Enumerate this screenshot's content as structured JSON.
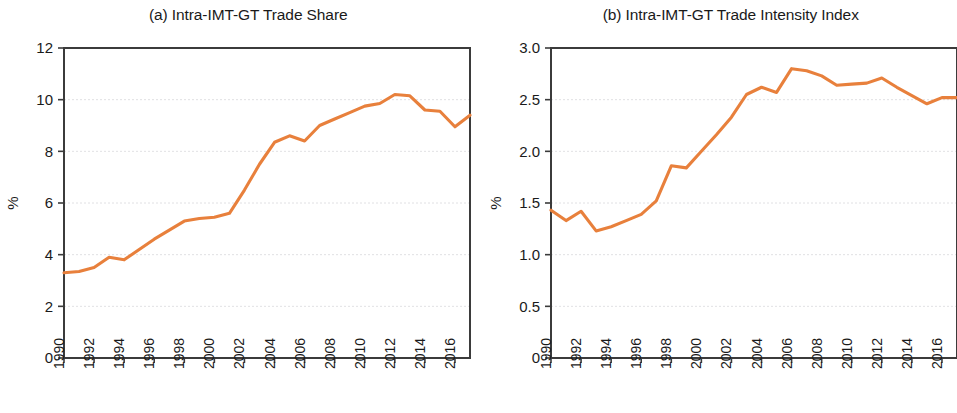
{
  "figure": {
    "panels": [
      {
        "id": "panel-a",
        "title": "(a) Intra-IMT-GT Trade Share",
        "ylabel": "%"
      },
      {
        "id": "panel-b",
        "title": "(b) Intra-IMT-GT Trade Intensity Index",
        "ylabel": "%"
      }
    ]
  },
  "chart_data": [
    {
      "type": "line",
      "title": "(a) Intra-IMT-GT Trade Share",
      "xlabel": "",
      "ylabel": "%",
      "ylim": [
        0,
        12
      ],
      "yticks": [
        0,
        2,
        4,
        6,
        8,
        10,
        12
      ],
      "ytick_labels": [
        "0",
        "2",
        "4",
        "6",
        "8",
        "10",
        "12"
      ],
      "xlim": [
        1990,
        2017
      ],
      "xticks": [
        1990,
        1992,
        1994,
        1996,
        1998,
        2000,
        2002,
        2004,
        2006,
        2008,
        2010,
        2012,
        2014,
        2016
      ],
      "xtick_labels": [
        "1990",
        "1992",
        "1994",
        "1996",
        "1998",
        "2000",
        "2002",
        "2004",
        "2006",
        "2008",
        "2010",
        "2012",
        "2014",
        "2016"
      ],
      "grid": true,
      "legend": "none",
      "line_color": "#E8803C",
      "x": [
        1990,
        1991,
        1992,
        1993,
        1994,
        1995,
        1996,
        1997,
        1998,
        1999,
        2000,
        2001,
        2002,
        2003,
        2004,
        2005,
        2006,
        2007,
        2008,
        2009,
        2010,
        2011,
        2012,
        2013,
        2014,
        2015,
        2016,
        2017
      ],
      "series": [
        {
          "name": "Intra-IMT-GT Trade Share",
          "values": [
            3.3,
            3.35,
            3.5,
            3.9,
            3.8,
            4.2,
            4.6,
            4.95,
            5.3,
            5.4,
            5.45,
            5.6,
            6.5,
            7.5,
            8.35,
            8.6,
            8.4,
            9.0,
            9.25,
            9.5,
            9.75,
            9.85,
            10.2,
            10.15,
            9.6,
            9.55,
            8.95,
            9.4
          ]
        }
      ]
    },
    {
      "type": "line",
      "title": "(b) Intra-IMT-GT Trade Intensity Index",
      "xlabel": "",
      "ylabel": "%",
      "ylim": [
        0,
        3.0
      ],
      "yticks": [
        0,
        0.5,
        1.0,
        1.5,
        2.0,
        2.5,
        3.0
      ],
      "ytick_labels": [
        "0",
        "0.5",
        "1.0",
        "1.5",
        "2.0",
        "2.5",
        "3.0"
      ],
      "xlim": [
        1990,
        2017
      ],
      "xticks": [
        1990,
        1992,
        1994,
        1996,
        1998,
        2000,
        2002,
        2004,
        2006,
        2008,
        2010,
        2012,
        2014,
        2016
      ],
      "xtick_labels": [
        "1990",
        "1992",
        "1994",
        "1996",
        "1998",
        "2000",
        "2002",
        "2004",
        "2006",
        "2008",
        "2010",
        "2012",
        "2014",
        "2016"
      ],
      "grid": true,
      "legend": "none",
      "line_color": "#E8803C",
      "x": [
        1990,
        1991,
        1992,
        1993,
        1994,
        1995,
        1996,
        1997,
        1998,
        1999,
        2000,
        2001,
        2002,
        2003,
        2004,
        2005,
        2006,
        2007,
        2008,
        2009,
        2010,
        2011,
        2012,
        2013,
        2014,
        2015,
        2016,
        2017
      ],
      "series": [
        {
          "name": "Intra-IMT-GT Trade Intensity Index",
          "values": [
            1.43,
            1.33,
            1.42,
            1.23,
            1.27,
            1.33,
            1.39,
            1.52,
            1.86,
            1.84,
            2.0,
            2.16,
            2.33,
            2.55,
            2.62,
            2.57,
            2.8,
            2.78,
            2.73,
            2.64,
            2.65,
            2.66,
            2.71,
            2.62,
            2.54,
            2.46,
            2.52,
            2.52
          ]
        }
      ]
    }
  ]
}
